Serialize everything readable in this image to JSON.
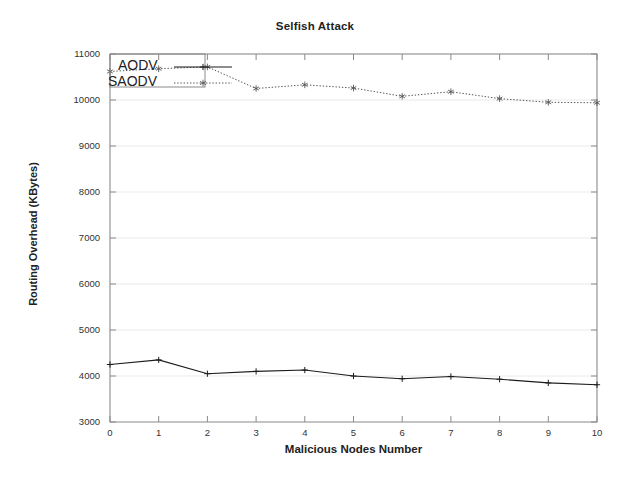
{
  "chart_data": {
    "type": "line",
    "title": "Selfish Attack",
    "xlabel": "Malicious Nodes Number",
    "ylabel": "Routing Overhead (KBytes)",
    "x": [
      0,
      1,
      2,
      3,
      4,
      5,
      6,
      7,
      8,
      9,
      10
    ],
    "xlim": [
      0,
      10
    ],
    "ylim": [
      3000,
      11000
    ],
    "xticks": [
      "0",
      "1",
      "2",
      "3",
      "4",
      "5",
      "6",
      "7",
      "8",
      "9",
      "10"
    ],
    "yticks": [
      "3000",
      "4000",
      "5000",
      "6000",
      "7000",
      "8000",
      "9000",
      "10000",
      "11000"
    ],
    "grid": true,
    "legend_position": "upper-left",
    "series": [
      {
        "name": "AODV",
        "style": "solid",
        "marker": "plus",
        "color": "#1c1c1c",
        "values": [
          4250,
          4350,
          4050,
          4100,
          4130,
          4000,
          3940,
          3990,
          3930,
          3850,
          3810
        ]
      },
      {
        "name": "SAODV",
        "style": "dotted",
        "marker": "star",
        "color": "#555555",
        "values": [
          10620,
          10680,
          10720,
          10250,
          10330,
          10260,
          10080,
          10180,
          10030,
          9950,
          9940
        ]
      }
    ]
  },
  "legend": {
    "entries": [
      {
        "label": "AODV"
      },
      {
        "label": "SAODV"
      }
    ]
  }
}
